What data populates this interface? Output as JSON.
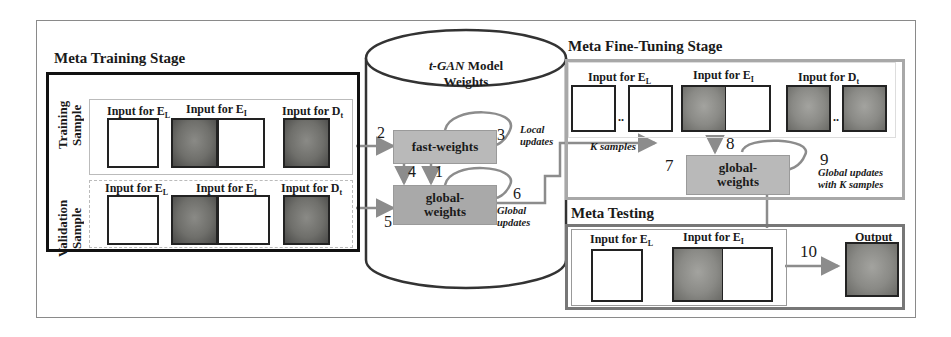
{
  "diagram": {
    "meta_training": {
      "title": "Meta Training Stage",
      "training_label_1": "Training",
      "training_label_2": "Sample",
      "validation_label_1": "Validation",
      "validation_label_2": "Sample",
      "input_EL": "Input for E",
      "input_EL_sub": "L",
      "input_EI": "Input for E",
      "input_EI_sub": "I",
      "input_Dt": "Input for D",
      "input_Dt_sub": "t"
    },
    "model": {
      "title_italic": "t-GAN",
      "title_rest": " Model",
      "title_line2": "Weights",
      "fast_weights": "fast-weights",
      "global_weights_1": "global-",
      "global_weights_2": "weights",
      "local_updates_1": "Local",
      "local_updates_2": "updates",
      "global_updates_1": "Global",
      "global_updates_2": "updates"
    },
    "meta_finetuning": {
      "title": "Meta Fine-Tuning Stage",
      "input_EL": "Input for E",
      "input_EL_sub": "L",
      "input_EI": "Input for E",
      "input_EI_sub": "I",
      "input_Dt": "Input for D",
      "input_Dt_sub": "t",
      "k_samples": "K samples",
      "ellipsis": "..",
      "global_weights_1": "global-",
      "global_weights_2": "weights",
      "global_updates_1": "Global updates",
      "global_updates_2": "with K samples"
    },
    "meta_testing": {
      "title": "Meta Testing",
      "input_EL": "Input for E",
      "input_EL_sub": "L",
      "input_EI": "Input for E",
      "input_EI_sub": "I",
      "output": "Output"
    },
    "step_numbers": [
      "1",
      "2",
      "3",
      "4",
      "5",
      "6",
      "7",
      "8",
      "9",
      "10"
    ],
    "colors": {
      "arrow": "#8c8c8c",
      "box_fill": "#b9b9b9",
      "meta_training_border": "#111111",
      "finetune_border": "#a8a8a8",
      "testing_border": "#777777"
    }
  }
}
